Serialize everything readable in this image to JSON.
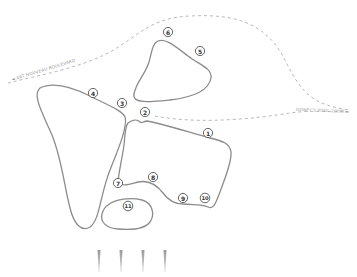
{
  "map": {
    "routes": [
      {
        "id": "route-left",
        "label": "◄ ART NOUVEAU BOULEVARD"
      },
      {
        "id": "route-right",
        "label": "DONEY'S POOL 200M ►"
      }
    ],
    "markers": [
      {
        "number": "1",
        "x": 208,
        "y": 133
      },
      {
        "number": "2",
        "x": 145,
        "y": 112
      },
      {
        "number": "3",
        "x": 122,
        "y": 103
      },
      {
        "number": "4",
        "x": 93,
        "y": 93
      },
      {
        "number": "5",
        "x": 200,
        "y": 51
      },
      {
        "number": "6",
        "x": 168,
        "y": 32
      },
      {
        "number": "7",
        "x": 118,
        "y": 183
      },
      {
        "number": "8",
        "x": 153,
        "y": 177
      },
      {
        "number": "9",
        "x": 183,
        "y": 198
      },
      {
        "number": "10",
        "x": 205,
        "y": 198
      },
      {
        "number": "11",
        "x": 128,
        "y": 206
      }
    ],
    "regions": [
      {
        "id": "region-north",
        "label": "north-plot"
      },
      {
        "id": "region-west",
        "label": "west-plot"
      },
      {
        "id": "region-central",
        "label": "central-plot"
      },
      {
        "id": "region-south",
        "label": "south-plot"
      }
    ],
    "spikes": [
      {
        "x": 99
      },
      {
        "x": 121
      },
      {
        "x": 143
      },
      {
        "x": 165
      }
    ],
    "colors": {
      "outline": "#8c8c8c",
      "dashed_path": "#b0b0b0",
      "marker_stroke": "#555555",
      "label_text": "#9a9a9a",
      "background": "#ffffff"
    }
  }
}
